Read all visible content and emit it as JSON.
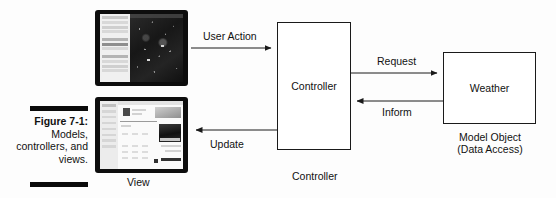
{
  "figure": {
    "caption_number": "Figure 7-1:",
    "caption_description": "Models, controllers, and views."
  },
  "diagram": {
    "type": "flow-diagram",
    "title": "Models, controllers, and views",
    "boxes": [
      {
        "id": "controller",
        "label": "Controller",
        "caption": "Controller"
      },
      {
        "id": "weather",
        "label": "Weather",
        "caption": "Model Object (Data Access)"
      }
    ],
    "nodes": [
      {
        "id": "view-map",
        "kind": "tablet-screenshot",
        "caption": ""
      },
      {
        "id": "view-detail",
        "kind": "tablet-screenshot",
        "caption": "View"
      }
    ],
    "arrows": [
      {
        "id": "user-action",
        "label": "User Action",
        "from": "view-map",
        "to": "controller",
        "direction": "right"
      },
      {
        "id": "update",
        "label": "Update",
        "from": "controller",
        "to": "view-detail",
        "direction": "left"
      },
      {
        "id": "request",
        "label": "Request",
        "from": "controller",
        "to": "weather",
        "direction": "right"
      },
      {
        "id": "inform",
        "label": "Inform",
        "from": "weather",
        "to": "controller",
        "direction": "left"
      }
    ],
    "captions": {
      "view": "View",
      "controller": "Controller",
      "model_object_line1": "Model Object",
      "model_object_line2": "(Data Access)"
    },
    "colors": {
      "stroke": "#1a1a1a",
      "rule": "#0a0a0a",
      "background": "#fdfdfd",
      "bezel": "#0d0d0d"
    }
  }
}
